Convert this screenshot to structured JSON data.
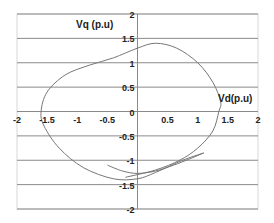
{
  "chart_data": {
    "type": "line",
    "title": "",
    "xlabel": "Vd(p.u)",
    "ylabel": "Vq (p.u)",
    "xlim": [
      -2,
      2
    ],
    "ylim": [
      -2,
      2
    ],
    "grid": {
      "horizontal": true,
      "vertical": false
    },
    "legend": null,
    "x_ticks": [
      "-2",
      "-1.5",
      "-1",
      "-0.5",
      "0",
      "0.5",
      "1",
      "1.5",
      "2"
    ],
    "y_ticks": [
      "2",
      "1.5",
      "1",
      "0.5",
      "0",
      "-0.5",
      "-1",
      "-1.5",
      "-2"
    ],
    "series": [
      {
        "name": "trajectory-loop",
        "color": "#777777",
        "points": [
          [
            1.1,
            -0.85
          ],
          [
            0.75,
            -1.0
          ],
          [
            0.3,
            -1.25
          ],
          [
            0.0,
            -1.38
          ],
          [
            -0.4,
            -1.38
          ],
          [
            -0.9,
            -1.15
          ],
          [
            -1.3,
            -0.75
          ],
          [
            -1.55,
            -0.3
          ],
          [
            -1.6,
            0.0
          ],
          [
            -1.5,
            0.4
          ],
          [
            -1.2,
            0.75
          ],
          [
            -0.8,
            0.95
          ],
          [
            -0.4,
            1.1
          ],
          [
            0.0,
            1.3
          ],
          [
            0.3,
            1.4
          ],
          [
            0.65,
            1.3
          ],
          [
            1.0,
            1.0
          ],
          [
            1.25,
            0.6
          ],
          [
            1.38,
            0.2
          ],
          [
            1.35,
            0.0
          ],
          [
            1.25,
            -0.4
          ],
          [
            1.0,
            -0.75
          ],
          [
            0.7,
            -1.0
          ],
          [
            0.3,
            -1.2
          ],
          [
            -0.2,
            -1.35
          ]
        ]
      },
      {
        "name": "trajectory-arc",
        "color": "#777777",
        "points": [
          [
            -0.5,
            -1.1
          ],
          [
            -0.25,
            -1.22
          ],
          [
            0.0,
            -1.27
          ],
          [
            0.3,
            -1.22
          ],
          [
            0.6,
            -1.1
          ],
          [
            0.85,
            -0.98
          ],
          [
            1.1,
            -0.85
          ]
        ]
      }
    ]
  }
}
